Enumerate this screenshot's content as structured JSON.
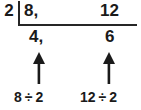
{
  "diagram": {
    "type": "ratio-simplification-division",
    "divisor": "2",
    "dividend": {
      "left": "8,",
      "right": "12"
    },
    "quotient": {
      "left": "4,",
      "right": "6"
    },
    "captions": [
      {
        "name": "left",
        "operand_a": "8",
        "operator": "÷",
        "operand_b": "2"
      },
      {
        "name": "right",
        "operand_a": "12",
        "operator": "÷",
        "operand_b": "2"
      }
    ],
    "arrows": [
      {
        "name": "left-arrow",
        "direction": "up"
      },
      {
        "name": "right-arrow",
        "direction": "up"
      }
    ],
    "colors": {
      "ink": "#1a1a1a",
      "rule": "#262626",
      "background": "#ffffff"
    }
  }
}
